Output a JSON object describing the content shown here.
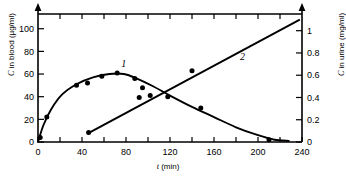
{
  "chart_data": {
    "type": "line",
    "title": "",
    "xlabel_italic": "t",
    "xlabel_unit": "(min)",
    "xlabel": "t (min)",
    "ylabel_left_italic": "C",
    "ylabel_left_rest": "in blood  (µg/ml)",
    "ylabel_left": "C in blood (µg/ml)",
    "ylabel_right_italic": "C",
    "ylabel_right_rest": "in urine  (mg/ml)",
    "ylabel_right": "C in urine (mg/ml)",
    "xlim": [
      0,
      240
    ],
    "ylim_left": [
      0,
      113
    ],
    "ylim_right": [
      0,
      1.15
    ],
    "grid": false,
    "legend": "inline-curve-labels",
    "x_ticks_major": [
      0,
      40,
      80,
      120,
      160,
      200,
      240
    ],
    "x_ticks_major_labels": [
      "0",
      "40",
      "80",
      "120",
      "160",
      "200",
      "240"
    ],
    "x_ticks_minor": [
      20,
      60,
      100,
      140,
      180,
      220
    ],
    "x_ticks_top": [
      20,
      40,
      60,
      80,
      100,
      120,
      140,
      160,
      180,
      200,
      220
    ],
    "y_ticks_left": [
      0,
      20,
      40,
      60,
      80,
      100
    ],
    "y_ticks_left_labels": [
      "0",
      "20",
      "40",
      "60",
      "80",
      "100"
    ],
    "y_ticks_right": [
      0,
      0.2,
      0.4,
      0.6,
      0.8,
      1
    ],
    "y_ticks_right_labels": [
      "0",
      "0.2",
      "0.4",
      "0.6",
      "0.8",
      "1"
    ],
    "series": [
      {
        "name": "1",
        "label": "1",
        "label_x": 78,
        "label_y": 66,
        "axis": "left",
        "style": "curve-with-points",
        "points": [
          {
            "x": 2,
            "y": 4
          },
          {
            "x": 8,
            "y": 22
          },
          {
            "x": 35,
            "y": 50
          },
          {
            "x": 45,
            "y": 52
          },
          {
            "x": 58,
            "y": 58
          },
          {
            "x": 72,
            "y": 61
          },
          {
            "x": 88,
            "y": 56
          },
          {
            "x": 95,
            "y": 48
          },
          {
            "x": 102,
            "y": 41
          },
          {
            "x": 118,
            "y": 40
          },
          {
            "x": 148,
            "y": 30
          },
          {
            "x": 210,
            "y": 2
          }
        ],
        "curve": [
          {
            "x": 0,
            "y": 0
          },
          {
            "x": 5,
            "y": 15
          },
          {
            "x": 12,
            "y": 29
          },
          {
            "x": 22,
            "y": 42
          },
          {
            "x": 35,
            "y": 51
          },
          {
            "x": 50,
            "y": 57
          },
          {
            "x": 65,
            "y": 60
          },
          {
            "x": 78,
            "y": 60
          },
          {
            "x": 90,
            "y": 56
          },
          {
            "x": 105,
            "y": 49
          },
          {
            "x": 120,
            "y": 41
          },
          {
            "x": 140,
            "y": 31
          },
          {
            "x": 160,
            "y": 22
          },
          {
            "x": 180,
            "y": 13
          },
          {
            "x": 200,
            "y": 6
          },
          {
            "x": 215,
            "y": 2
          },
          {
            "x": 228,
            "y": 1
          }
        ]
      },
      {
        "name": "2",
        "label": "2",
        "label_x": 186,
        "label_y": 0.74,
        "axis": "right",
        "style": "straight-line-with-points",
        "points": [
          {
            "x": 46,
            "y": 0.085
          },
          {
            "x": 92,
            "y": 0.4
          },
          {
            "x": 140,
            "y": 0.64
          }
        ],
        "line_from": {
          "x": 45,
          "y": 0.075
        },
        "line_to": {
          "x": 238,
          "y": 1.1
        }
      }
    ]
  },
  "axes": {
    "left_arrow": true,
    "right_arrow": true,
    "top_border": true,
    "bottom_border": true
  }
}
